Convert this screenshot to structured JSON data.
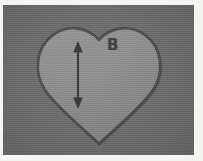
{
  "figure": {
    "kind": "photograph",
    "labels": {
      "region_label": "B"
    },
    "annotations": {
      "arrow_name": "double-headed-vertical-arrow",
      "arrow_heads": "both",
      "arrow_orientation": "vertical"
    },
    "colors": {
      "background": "#6b6b6b",
      "heart_fill": "#8c8c8c",
      "heart_outline": "#3a3a3a",
      "annotation": "#333333",
      "border": "#f4f4f2"
    },
    "geometry": {
      "heart_left": 38,
      "heart_right": 163,
      "heart_top": 24,
      "heart_bottom": 144,
      "heart_cleft_x": 100,
      "heart_cleft_y": 34,
      "arrow_x": 78,
      "arrow_top_y": 42,
      "arrow_bottom_y": 104
    }
  }
}
